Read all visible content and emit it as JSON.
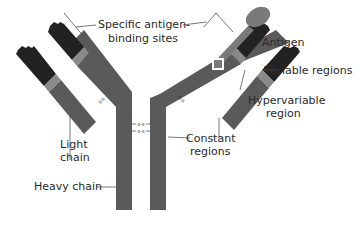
{
  "diagram": {
    "colors": {
      "background": "#ffffff",
      "constant": "#5a5a5a",
      "variable": "#222222",
      "hypervariable": "#8a8a8a",
      "antigen": "#7a7a7a",
      "leader": "#555555",
      "text": "#2a2a2a"
    },
    "labels": {
      "binding_sites_line1": "Specific antigen-",
      "binding_sites_line2": "binding sites",
      "antigen": "Antigen",
      "variable_regions": "Variable regions",
      "hypervariable_line1": "Hypervariable",
      "hypervariable_line2": "region",
      "light_chain_line1": "Light",
      "light_chain_line2": "chain",
      "constant_line1": "Constant",
      "constant_line2": "regions",
      "heavy_chain": "Heavy chain"
    },
    "disulfide_bonds": {
      "hinge_top": "s-s",
      "hinge_bottom": "s-s",
      "left_light": "s-s",
      "right_light": "s-s"
    }
  }
}
